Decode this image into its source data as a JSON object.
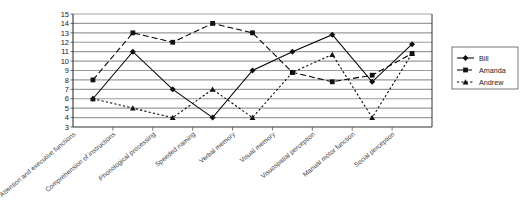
{
  "chart_data": {
    "type": "line",
    "title": "",
    "xlabel": "",
    "ylabel": "",
    "ylim": [
      3,
      15
    ],
    "ytick_values": [
      3,
      4,
      5,
      6,
      7,
      8,
      9,
      10,
      11,
      12,
      13,
      14,
      15
    ],
    "grid": true,
    "legend_position": "right",
    "categories": [
      "Attention and executive functions",
      "Comprehension of instructions",
      "Phonological processing",
      "Speeded naming",
      "Verbal memory",
      "Visual memory",
      "Visuospatial perception",
      "Manual motor function",
      "Social perception"
    ],
    "series": [
      {
        "name": "Bill",
        "marker": "diamond",
        "linestyle": "solid",
        "color": "#000000",
        "values": [
          6,
          11,
          7,
          4,
          9,
          11,
          12.8,
          7.8,
          11.8
        ]
      },
      {
        "name": "Amanda",
        "marker": "square",
        "linestyle": "dashed",
        "color": "#000000",
        "values": [
          8,
          13,
          12,
          14,
          13,
          8.8,
          7.8,
          8.5,
          10.8
        ]
      },
      {
        "name": "Andrew",
        "marker": "triangle",
        "linestyle": "dotted",
        "color": "#000000",
        "values": [
          6,
          5,
          4,
          7,
          4,
          8.8,
          10.7,
          4,
          10.8
        ]
      }
    ]
  },
  "legend": {
    "items": [
      {
        "label": "Bill"
      },
      {
        "label": "Amanda"
      },
      {
        "label": "Andrew"
      }
    ]
  }
}
